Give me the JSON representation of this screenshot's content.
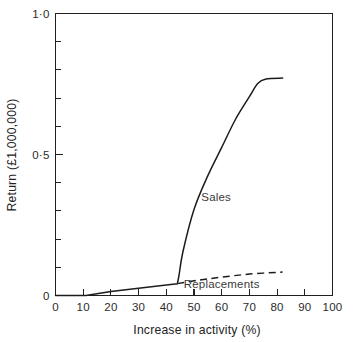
{
  "chart_data": {
    "type": "line",
    "title": "",
    "xlabel": "Increase in activity (%)",
    "ylabel": "Return (£1,000,000)",
    "xlim": [
      0,
      100
    ],
    "ylim": [
      0,
      1.0
    ],
    "grid": false,
    "legend_position": "inline-annotations",
    "x_ticks": [
      0,
      10,
      20,
      30,
      40,
      50,
      60,
      70,
      80,
      90,
      100
    ],
    "x_tick_labels": [
      "0",
      "10",
      "20",
      "30",
      "40",
      "50",
      "60",
      "70",
      "80",
      "90",
      "100"
    ],
    "y_ticks": [
      0,
      0.1,
      0.2,
      0.3,
      0.4,
      0.5,
      0.6,
      0.7,
      0.8,
      0.9,
      1.0
    ],
    "y_tick_labels": [
      "0",
      "",
      "",
      "",
      "",
      "0·5",
      "",
      "",
      "",
      "",
      "1·0"
    ],
    "series": [
      {
        "name": "Sales",
        "style": "solid",
        "label_x": 58,
        "label_y": 0.335,
        "points": [
          [
            0,
            0.0
          ],
          [
            11,
            0.0
          ],
          [
            20,
            0.014
          ],
          [
            30,
            0.026
          ],
          [
            40,
            0.037
          ],
          [
            44,
            0.042
          ],
          [
            44.6,
            0.072
          ],
          [
            46,
            0.155
          ],
          [
            50,
            0.305
          ],
          [
            55,
            0.425
          ],
          [
            60,
            0.525
          ],
          [
            65,
            0.625
          ],
          [
            70,
            0.705
          ],
          [
            73,
            0.752
          ],
          [
            76,
            0.768
          ],
          [
            82,
            0.771
          ]
        ]
      },
      {
        "name": "Replacements",
        "style": "dashed",
        "label_x": 60,
        "label_y": 0.028,
        "points": [
          [
            44,
            0.042
          ],
          [
            52,
            0.055
          ],
          [
            60,
            0.065
          ],
          [
            70,
            0.076
          ],
          [
            82,
            0.083
          ]
        ]
      }
    ]
  },
  "annotations": {
    "sales_label": "Sales",
    "replacements_label": "Replacements"
  }
}
